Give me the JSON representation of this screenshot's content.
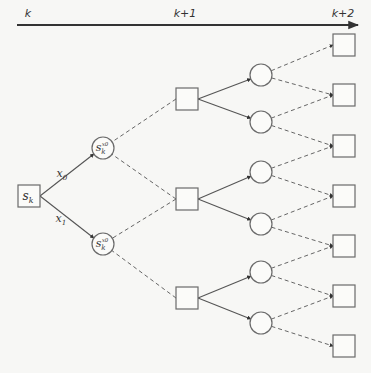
{
  "timeline": {
    "labels": [
      "k",
      "k+1",
      "k+2"
    ],
    "label_x": [
      28,
      185,
      343
    ],
    "y": 25,
    "x_start": 17,
    "x_end": 358
  },
  "root": {
    "label": "s",
    "sub": "k",
    "cx": 29,
    "cy": 196,
    "size": 22
  },
  "actions": [
    {
      "label": "x",
      "sub": "0",
      "x": 62,
      "y": 177
    },
    {
      "label": "x",
      "sub": "1",
      "x": 61,
      "y": 222
    }
  ],
  "post_decision_states": [
    {
      "label": "s",
      "sub": "k",
      "sup": "x0",
      "cx": 103,
      "cy": 148,
      "r": 11
    },
    {
      "label": "s",
      "sub": "k",
      "sup": "x0",
      "cx": 103,
      "cy": 244,
      "r": 11
    }
  ],
  "states_k1": [
    {
      "cx": 187,
      "cy": 99
    },
    {
      "cx": 187,
      "cy": 199
    },
    {
      "cx": 187,
      "cy": 298
    }
  ],
  "chance_k1": [
    {
      "cx": 261,
      "cy": 75,
      "parent": 0
    },
    {
      "cx": 261,
      "cy": 122,
      "parent": 0
    },
    {
      "cx": 261,
      "cy": 172,
      "parent": 1
    },
    {
      "cx": 261,
      "cy": 224,
      "parent": 1
    },
    {
      "cx": 261,
      "cy": 272,
      "parent": 2
    },
    {
      "cx": 261,
      "cy": 323,
      "parent": 2
    }
  ],
  "states_k2": [
    {
      "cx": 344,
      "cy": 45
    },
    {
      "cx": 344,
      "cy": 95
    },
    {
      "cx": 344,
      "cy": 146
    },
    {
      "cx": 344,
      "cy": 196
    },
    {
      "cx": 344,
      "cy": 246
    },
    {
      "cx": 344,
      "cy": 296
    },
    {
      "cx": 344,
      "cy": 346
    }
  ],
  "edges_dashed_pd_to_k1": [
    [
      0,
      0
    ],
    [
      0,
      1
    ],
    [
      1,
      1
    ],
    [
      1,
      2
    ]
  ],
  "edges_dashed_k2_to_chance": [
    [
      0,
      0
    ],
    [
      1,
      0
    ],
    [
      1,
      1
    ],
    [
      2,
      1
    ],
    [
      2,
      2
    ],
    [
      3,
      2
    ],
    [
      3,
      3
    ],
    [
      4,
      3
    ],
    [
      4,
      4
    ],
    [
      5,
      4
    ],
    [
      5,
      5
    ],
    [
      6,
      5
    ]
  ],
  "colors": {
    "stroke": "#6a6a6a",
    "background": "#f7f7f5"
  }
}
